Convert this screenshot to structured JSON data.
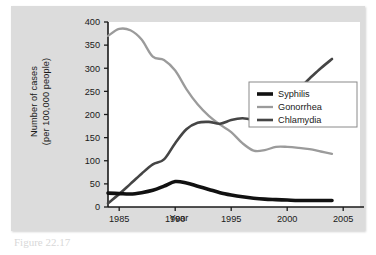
{
  "figure": {
    "background_color": "#dcdcdc",
    "plot_background_color": "#ffffff",
    "caption_fragment": "Figure 22.17"
  },
  "chart_data": {
    "type": "line",
    "title": "",
    "xlabel": "Year",
    "ylabel_line1": "Number of cases",
    "ylabel_line2": "(per 100,000 people)",
    "xlim": [
      1984,
      2006.5
    ],
    "ylim": [
      0,
      400
    ],
    "grid": false,
    "legend_position": "right-middle",
    "xticks": [
      1985,
      1990,
      1995,
      2000,
      2005
    ],
    "xtick_labels": [
      "1985",
      "1990",
      "1995",
      "2000",
      "2005"
    ],
    "yticks": [
      0,
      50,
      100,
      150,
      200,
      250,
      300,
      350,
      400
    ],
    "ytick_labels": [
      "0",
      "50",
      "100",
      "150",
      "200",
      "250",
      "300",
      "350",
      "400"
    ],
    "x": [
      1984,
      1985,
      1986,
      1987,
      1988,
      1989,
      1990,
      1991,
      1992,
      1993,
      1994,
      1995,
      1996,
      1997,
      1998,
      1999,
      2000,
      2001,
      2002,
      2003,
      2004
    ],
    "series": [
      {
        "name": "Syphilis",
        "color": "#111111",
        "width": 3.6,
        "values": [
          30,
          29,
          28,
          31,
          36,
          45,
          55,
          52,
          45,
          38,
          31,
          26,
          22,
          19,
          17,
          16,
          15,
          14,
          14,
          14,
          14
        ]
      },
      {
        "name": "Gonorrhea",
        "color": "#9b9b9b",
        "width": 2.3,
        "values": [
          370,
          385,
          382,
          362,
          325,
          318,
          295,
          255,
          222,
          197,
          178,
          162,
          138,
          122,
          123,
          130,
          130,
          128,
          125,
          120,
          115
        ]
      },
      {
        "name": "Chlamydia",
        "color": "#454545",
        "width": 2.6,
        "values": [
          8,
          28,
          50,
          72,
          92,
          103,
          138,
          168,
          182,
          184,
          180,
          188,
          192,
          190,
          205,
          225,
          250,
          256,
          278,
          300,
          320
        ]
      }
    ]
  },
  "legend": {
    "entries": [
      {
        "label": "Syphilis",
        "color": "#111111"
      },
      {
        "label": "Gonorrhea",
        "color": "#9b9b9b"
      },
      {
        "label": "Chlamydia",
        "color": "#454545"
      }
    ]
  }
}
